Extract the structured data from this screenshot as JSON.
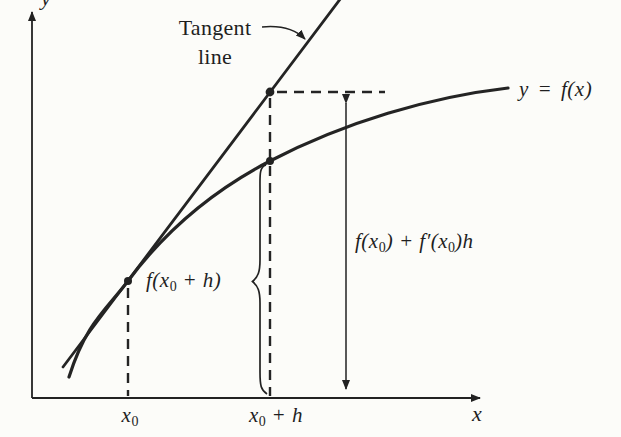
{
  "colors": {
    "ink": "#222222",
    "paper": "#fcfcf9"
  },
  "axes": {
    "x_label": "x",
    "y_label": "y"
  },
  "ticks": {
    "x0": {
      "parts": [
        "x",
        "0"
      ]
    },
    "x0_plus_h": {
      "parts": [
        "x",
        "0",
        " + h"
      ]
    }
  },
  "labels": {
    "tangent": {
      "line1": "Tangent",
      "line2": "line"
    },
    "curve_equation": "y = f(x)",
    "f_x0_plus_h": {
      "parts": [
        "f(x",
        "0",
        " + h)"
      ]
    },
    "linear_approx": {
      "parts": [
        "f(x",
        "0",
        ") + f′(x",
        "0",
        ")h"
      ]
    }
  }
}
